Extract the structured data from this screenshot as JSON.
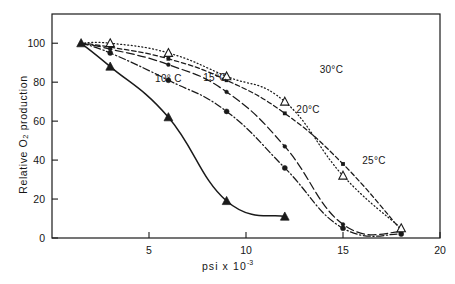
{
  "figure": {
    "type": "line-chart-scan",
    "background": "#ffffff",
    "ink_color": "#1a1a1a"
  },
  "axes": {
    "y_title_prefix": "Relative O",
    "y_title_sub": "2",
    "y_title_suffix": " production",
    "x_title_main": "psi x 10",
    "x_title_exp": "-3",
    "y_ticks": [
      "0",
      "20",
      "40",
      "60",
      "80",
      "100"
    ],
    "x_ticks": [
      "5",
      "10",
      "15",
      "20"
    ],
    "frame": "box"
  },
  "labels": [
    {
      "name": "label-10c",
      "text": "10° C",
      "x": 0.3,
      "y": 0.695
    },
    {
      "name": "label-15c",
      "text": "15°C",
      "x": 0.42,
      "y": 0.7
    },
    {
      "name": "label-20c",
      "text": "20°C",
      "x": 0.66,
      "y": 0.56
    },
    {
      "name": "label-25c",
      "text": "25°C",
      "x": 0.83,
      "y": 0.33
    },
    {
      "name": "label-30c",
      "text": "30°C",
      "x": 0.72,
      "y": 0.735
    }
  ],
  "chart_data": {
    "type": "line",
    "title": "",
    "subtitle": "",
    "xlabel": "psi x 10^-3",
    "ylabel": "Relative O2 production",
    "xlim": [
      0,
      20
    ],
    "ylim": [
      0,
      115
    ],
    "xticks": [
      5,
      10,
      15,
      20
    ],
    "yticks": [
      0,
      20,
      40,
      60,
      80,
      100
    ],
    "grid": false,
    "legend": "inline-annotations",
    "series": [
      {
        "name": "10° C",
        "linestyle": "solid",
        "marker": "filled-triangle",
        "x": [
          1.5,
          3.0,
          6.0,
          9.0,
          12.0
        ],
        "y": [
          100,
          88,
          62,
          19,
          11
        ]
      },
      {
        "name": "15°C",
        "linestyle": "dash-dot",
        "marker": "filled-circle",
        "x": [
          1.5,
          3.0,
          6.0,
          9.0,
          12.0,
          15.0,
          18.0
        ],
        "y": [
          100,
          95,
          81,
          65,
          36,
          5,
          2
        ]
      },
      {
        "name": "20°C",
        "linestyle": "long-dash",
        "marker": "filled-circle-small",
        "x": [
          1.5,
          3.0,
          6.0,
          9.0,
          12.0,
          15.0,
          18.0
        ],
        "y": [
          100,
          97,
          89,
          75,
          47,
          7,
          3
        ]
      },
      {
        "name": "25°C",
        "linestyle": "dashed",
        "marker": "filled-square-small",
        "x": [
          1.5,
          3.0,
          6.0,
          9.0,
          12.0,
          15.0,
          18.0
        ],
        "y": [
          100,
          98,
          92,
          81,
          64,
          38,
          4
        ]
      },
      {
        "name": "30°C",
        "linestyle": "dotted",
        "marker": "open-triangle",
        "x": [
          1.5,
          3.0,
          6.0,
          9.0,
          12.0,
          15.0,
          18.0
        ],
        "y": [
          100,
          100,
          95,
          83,
          70,
          32,
          5
        ]
      }
    ]
  }
}
